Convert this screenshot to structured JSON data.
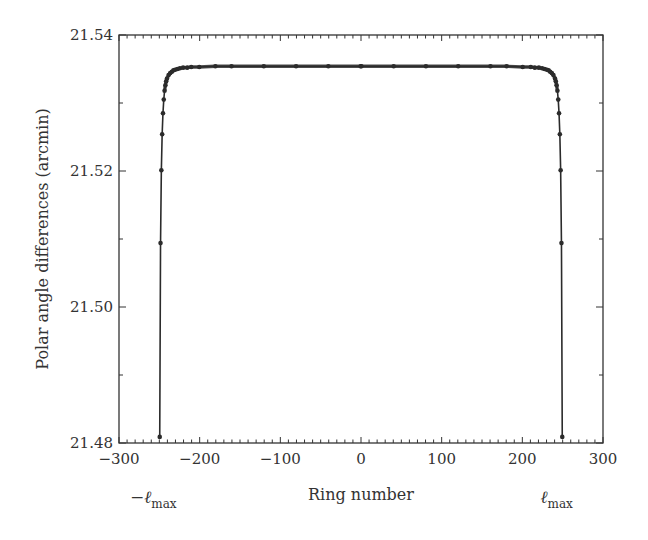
{
  "chart_data": {
    "type": "line",
    "title": "",
    "xlabel": "Ring number",
    "ylabel": "Polar angle differences (arcmin)",
    "xlim": [
      -300,
      300
    ],
    "ylim": [
      21.48,
      21.54
    ],
    "xticks": [
      -300,
      -200,
      -100,
      0,
      100,
      200,
      300
    ],
    "xtick_labels": [
      "−300",
      "−200",
      "−100",
      "0",
      "100",
      "200",
      "300"
    ],
    "yticks": [
      21.48,
      21.5,
      21.52,
      21.54
    ],
    "ytick_labels": [
      "21.48",
      "21.50",
      "21.52",
      "21.54"
    ],
    "x_minor_step": 10,
    "y_minor_step": 0.01,
    "grid": false,
    "legend": null,
    "annotations": [
      {
        "text": "−ℓ",
        "sub": "max",
        "x": -250
      },
      {
        "text": "ℓ",
        "sub": "max",
        "x": 250
      }
    ],
    "series": [
      {
        "name": "polar angle differences",
        "marker": "circle",
        "x": [
          -249.5,
          -248.5,
          -247.5,
          -246.5,
          -245.5,
          -244.5,
          -243.5,
          -242.5,
          -241.5,
          -240.5,
          -238.5,
          -236.5,
          -234.5,
          -232.5,
          -230.5,
          -227.5,
          -224.5,
          -220.5,
          -215.5,
          -210.5,
          -200.5,
          -180.5,
          -160.5,
          -120.5,
          -80.5,
          -40.5,
          -0.5,
          0.5,
          40.5,
          80.5,
          120.5,
          160.5,
          180.5,
          200.5,
          210.5,
          215.5,
          220.5,
          224.5,
          227.5,
          230.5,
          232.5,
          234.5,
          236.5,
          238.5,
          240.5,
          241.5,
          242.5,
          243.5,
          244.5,
          245.5,
          246.5,
          247.5,
          248.5,
          249.5
        ],
        "values": [
          21.4809,
          21.5094,
          21.5201,
          21.5254,
          21.5285,
          21.5305,
          21.5318,
          21.5326,
          21.5332,
          21.5336,
          21.5341,
          21.5344,
          21.5346,
          21.5348,
          21.5349,
          21.535,
          21.5351,
          21.5352,
          21.5352,
          21.5353,
          21.5353,
          21.5354,
          21.5354,
          21.5354,
          21.5354,
          21.5354,
          21.5354,
          21.5354,
          21.5354,
          21.5354,
          21.5354,
          21.5354,
          21.5354,
          21.5353,
          21.5353,
          21.5352,
          21.5352,
          21.5351,
          21.535,
          21.5349,
          21.5348,
          21.5346,
          21.5344,
          21.5341,
          21.5336,
          21.5332,
          21.5326,
          21.5318,
          21.5305,
          21.5285,
          21.5254,
          21.5201,
          21.5094,
          21.4809
        ]
      }
    ]
  },
  "colors": {
    "line": "#2b2b2b",
    "axis": "#333333",
    "background": "#ffffff"
  }
}
